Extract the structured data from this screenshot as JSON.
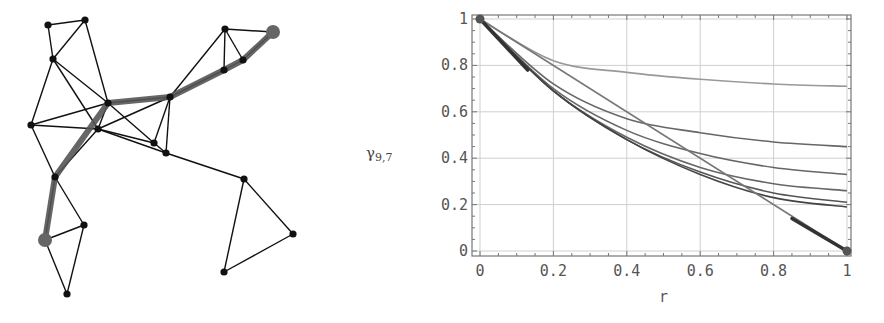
{
  "graph": {
    "nodes": [
      {
        "id": "A",
        "x": 48,
        "y": 25
      },
      {
        "id": "B",
        "x": 85,
        "y": 20
      },
      {
        "id": "C",
        "x": 53,
        "y": 59
      },
      {
        "id": "D",
        "x": 108,
        "y": 103
      },
      {
        "id": "E",
        "x": 31,
        "y": 125
      },
      {
        "id": "F",
        "x": 98,
        "y": 129
      },
      {
        "id": "G",
        "x": 154,
        "y": 143
      },
      {
        "id": "H",
        "x": 166,
        "y": 153
      },
      {
        "id": "I",
        "x": 170,
        "y": 97
      },
      {
        "id": "J",
        "x": 225,
        "y": 29
      },
      {
        "id": "K",
        "x": 273,
        "y": 32,
        "big": true
      },
      {
        "id": "L",
        "x": 243,
        "y": 60
      },
      {
        "id": "M",
        "x": 224,
        "y": 70
      },
      {
        "id": "N",
        "x": 55,
        "y": 177
      },
      {
        "id": "O",
        "x": 84,
        "y": 225
      },
      {
        "id": "P",
        "x": 45,
        "y": 240,
        "big": true
      },
      {
        "id": "Q",
        "x": 67,
        "y": 294
      },
      {
        "id": "R",
        "x": 244,
        "y": 179
      },
      {
        "id": "S",
        "x": 293,
        "y": 234
      },
      {
        "id": "T",
        "x": 224,
        "y": 272
      }
    ],
    "edges": [
      [
        "A",
        "B"
      ],
      [
        "A",
        "C"
      ],
      [
        "B",
        "C"
      ],
      [
        "B",
        "D"
      ],
      [
        "C",
        "E"
      ],
      [
        "C",
        "D"
      ],
      [
        "C",
        "F"
      ],
      [
        "D",
        "E"
      ],
      [
        "D",
        "I"
      ],
      [
        "D",
        "G"
      ],
      [
        "D",
        "F"
      ],
      [
        "E",
        "F"
      ],
      [
        "E",
        "N"
      ],
      [
        "F",
        "I"
      ],
      [
        "F",
        "G"
      ],
      [
        "F",
        "H"
      ],
      [
        "G",
        "H"
      ],
      [
        "G",
        "I"
      ],
      [
        "H",
        "I"
      ],
      [
        "I",
        "J"
      ],
      [
        "I",
        "M"
      ],
      [
        "J",
        "M"
      ],
      [
        "J",
        "L"
      ],
      [
        "J",
        "K"
      ],
      [
        "M",
        "L"
      ],
      [
        "L",
        "K"
      ],
      [
        "F",
        "N"
      ],
      [
        "N",
        "O"
      ],
      [
        "N",
        "P"
      ],
      [
        "O",
        "P"
      ],
      [
        "O",
        "Q"
      ],
      [
        "P",
        "Q"
      ],
      [
        "H",
        "R"
      ],
      [
        "R",
        "S"
      ],
      [
        "R",
        "T"
      ],
      [
        "S",
        "T"
      ]
    ],
    "highlighted_path": [
      "K",
      "L",
      "M",
      "I",
      "D",
      "N",
      "P"
    ],
    "colors": {
      "edge": "#111111",
      "node": "#111111",
      "path": "#555555",
      "endpoint": "#666666"
    }
  },
  "chart_data": {
    "type": "line",
    "title": "",
    "xlabel": "r",
    "ylabel": "γ9,7",
    "xlim": [
      0,
      1
    ],
    "ylim": [
      0,
      1
    ],
    "grid": true,
    "x_ticks": [
      "0",
      "0.2",
      "0.4",
      "0.6",
      "0.8",
      "1"
    ],
    "y_ticks": [
      "0",
      "0.2",
      "0.4",
      "0.6",
      "0.8",
      "1"
    ],
    "x": [
      0,
      0.2,
      0.4,
      0.6,
      0.8,
      1.0
    ],
    "series": [
      {
        "name": "curve-1",
        "color": "#999999",
        "values": [
          1.0,
          0.82,
          0.77,
          0.74,
          0.72,
          0.71
        ]
      },
      {
        "name": "curve-2",
        "color": "#666666",
        "values": [
          1.0,
          0.72,
          0.57,
          0.51,
          0.47,
          0.45
        ]
      },
      {
        "name": "curve-3",
        "color": "#666666",
        "values": [
          1.0,
          0.7,
          0.52,
          0.42,
          0.36,
          0.33
        ]
      },
      {
        "name": "curve-4",
        "color": "#666666",
        "values": [
          1.0,
          0.69,
          0.49,
          0.36,
          0.29,
          0.26
        ]
      },
      {
        "name": "curve-5",
        "color": "#555555",
        "values": [
          1.0,
          0.69,
          0.48,
          0.34,
          0.25,
          0.21
        ]
      },
      {
        "name": "curve-6",
        "color": "#444444",
        "values": [
          1.0,
          0.69,
          0.48,
          0.33,
          0.23,
          0.19
        ]
      },
      {
        "name": "diagonal",
        "color": "#777777",
        "values": [
          1.0,
          0.8,
          0.6,
          0.4,
          0.2,
          0.0
        ]
      }
    ],
    "annotations": [
      {
        "type": "tangent-segment",
        "from": [
          0,
          1
        ],
        "to": [
          0.13,
          0.78
        ]
      },
      {
        "type": "tangent-segment",
        "from": [
          0.85,
          0.14
        ],
        "to": [
          1,
          0
        ]
      },
      {
        "type": "marker",
        "at": [
          0,
          1
        ]
      },
      {
        "type": "marker",
        "at": [
          1,
          0
        ]
      }
    ]
  }
}
